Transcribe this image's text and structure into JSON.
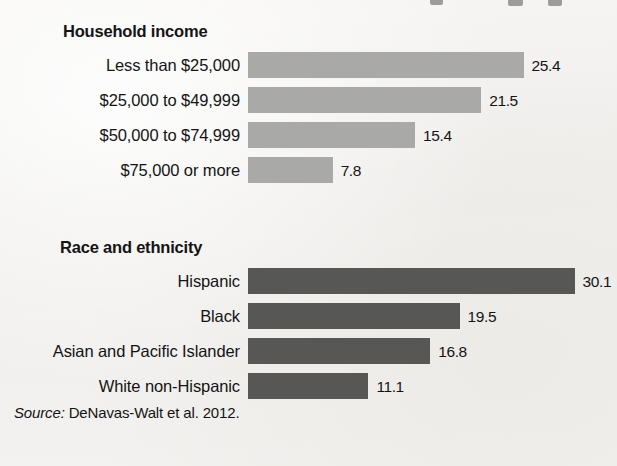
{
  "chart_data": {
    "type": "bar",
    "orientation": "horizontal",
    "title": "",
    "xlabel": "",
    "ylabel": "",
    "grid": false,
    "legend": "none",
    "axis_visible": false,
    "value_label_precision": 1,
    "xlim": [
      0,
      31
    ],
    "groups": [
      {
        "heading": "Household income",
        "color": "#a9a9a7",
        "categories": [
          "Less than $25,000",
          "$25,000 to $49,999",
          "$50,000 to $74,999",
          "$75,000 or more"
        ],
        "values": [
          25.4,
          21.5,
          15.4,
          7.8
        ],
        "value_labels": [
          "25.4",
          "21.5",
          "15.4",
          "7.8"
        ]
      },
      {
        "heading": "Race and ethnicity",
        "color": "#575756",
        "categories": [
          "Hispanic",
          "Black",
          "Asian and Pacific Islander",
          "White non-Hispanic"
        ],
        "values": [
          30.1,
          19.5,
          16.8,
          11.1
        ],
        "value_labels": [
          "30.1",
          "19.5",
          "16.8",
          "11.1"
        ]
      }
    ]
  },
  "source": {
    "label": "Source:",
    "text": "DeNavas-Walt et al. 2012."
  },
  "colors": {
    "background": "#f2f1ef",
    "bar_light": "#a9a9a7",
    "bar_dark": "#575756",
    "text": "#141414"
  }
}
